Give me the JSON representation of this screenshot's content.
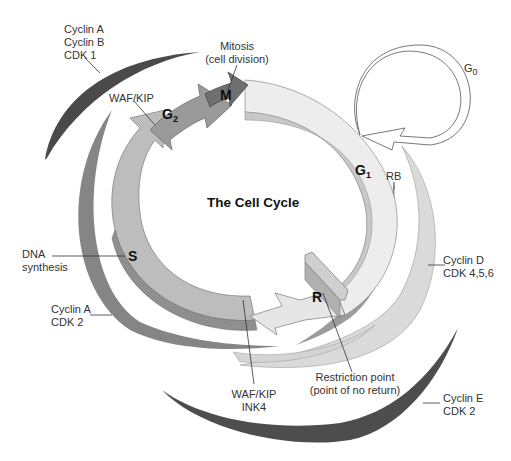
{
  "diagram": {
    "title": "The Cell Cycle",
    "phases": [
      {
        "id": "M",
        "label": "M",
        "description": "Mitosis",
        "description_line2": "(cell division)",
        "color": "#6f6f6f"
      },
      {
        "id": "G1",
        "label": "G",
        "subscript": "1",
        "color": "#ececec"
      },
      {
        "id": "S",
        "label": "S",
        "description": "DNA",
        "description_line2": "synthesis",
        "color": "#bdbdbd"
      },
      {
        "id": "G2",
        "label": "G",
        "subscript": "2",
        "color": "#9a9a9a"
      },
      {
        "id": "G0",
        "label": "G",
        "subscript": "0",
        "color": "#ffffff"
      }
    ],
    "restriction_point": {
      "marker": "R",
      "label_line1": "Restriction point",
      "label_line2": "(point of no return)"
    },
    "regulators": [
      {
        "id": "cyclinA-cyclinB-cdk1",
        "lines": [
          "Cyclin A",
          "Cyclin B",
          "CDK 1"
        ],
        "color": "#4a4a4a"
      },
      {
        "id": "waf-kip-top",
        "lines": [
          "WAF/KIP"
        ]
      },
      {
        "id": "rb",
        "lines": [
          "RB"
        ],
        "color": "#9c9c9c"
      },
      {
        "id": "cyclinD-cdk456",
        "lines": [
          "Cyclin D",
          "CDK 4,5,6"
        ],
        "color": "#d9d9d9"
      },
      {
        "id": "cyclinA-cdk2",
        "lines": [
          "Cyclin A",
          "CDK 2"
        ],
        "color": "#858585"
      },
      {
        "id": "waf-kip-ink4",
        "lines": [
          "WAF/KIP",
          "INK4"
        ]
      },
      {
        "id": "cyclinE-cdk2",
        "lines": [
          "Cyclin E",
          "CDK 2"
        ],
        "color": "#4d4d4d"
      }
    ]
  }
}
